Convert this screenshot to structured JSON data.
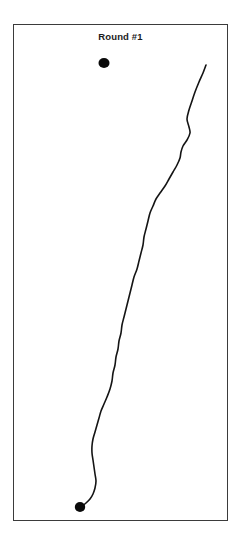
{
  "figure": {
    "title": "Round #1",
    "background_color": "#ffffff",
    "frame": {
      "border_color": "#3b3b3b",
      "border_width_px": 1.2,
      "x": 13,
      "y": 24,
      "width": 215,
      "height": 497
    }
  },
  "chart_data": {
    "type": "line",
    "title": "Round #1",
    "subtitle": "",
    "xlabel": "",
    "ylabel": "",
    "xlim": [
      13,
      228
    ],
    "ylim": [
      24,
      521
    ],
    "grid": false,
    "legend": null,
    "axes_visible": false,
    "tick_labels_x": [],
    "tick_labels_y": [],
    "series": [
      {
        "name": "track-path",
        "kind": "path",
        "color": "#141414",
        "line_width": 1.6,
        "points": [
          [
            206,
            65
          ],
          [
            203,
            73
          ],
          [
            199,
            82
          ],
          [
            195,
            92
          ],
          [
            192,
            101
          ],
          [
            189,
            110
          ],
          [
            187,
            119
          ],
          [
            189,
            127
          ],
          [
            190,
            133
          ],
          [
            187,
            140
          ],
          [
            183,
            146
          ],
          [
            181,
            152
          ],
          [
            180,
            158
          ],
          [
            177,
            165
          ],
          [
            173,
            172
          ],
          [
            169,
            179
          ],
          [
            165,
            186
          ],
          [
            160,
            193
          ],
          [
            156,
            199
          ],
          [
            153,
            206
          ],
          [
            150,
            213
          ],
          [
            148,
            221
          ],
          [
            146,
            229
          ],
          [
            144,
            237
          ],
          [
            143,
            245
          ],
          [
            141,
            253
          ],
          [
            139,
            261
          ],
          [
            137,
            269
          ],
          [
            134,
            277
          ],
          [
            132,
            285
          ],
          [
            130,
            293
          ],
          [
            128,
            301
          ],
          [
            126,
            309
          ],
          [
            124,
            317
          ],
          [
            122,
            325
          ],
          [
            121,
            333
          ],
          [
            119,
            341
          ],
          [
            118,
            349
          ],
          [
            116,
            357
          ],
          [
            115,
            365
          ],
          [
            113,
            373
          ],
          [
            112,
            381
          ],
          [
            110,
            389
          ],
          [
            107,
            397
          ],
          [
            104,
            404
          ],
          [
            101,
            411
          ],
          [
            99,
            418
          ],
          [
            97,
            425
          ],
          [
            95,
            432
          ],
          [
            93,
            439
          ],
          [
            92,
            446
          ],
          [
            92,
            453
          ],
          [
            93,
            460
          ],
          [
            94,
            467
          ],
          [
            95,
            474
          ],
          [
            96,
            481
          ],
          [
            95,
            488
          ],
          [
            93,
            494
          ],
          [
            90,
            499
          ],
          [
            86,
            503
          ],
          [
            82,
            506
          ],
          [
            80,
            507
          ]
        ]
      }
    ],
    "markers": [
      {
        "name": "start-marker-dot",
        "x": 104,
        "y": 63,
        "radius_x": 5.5,
        "radius_y": 5.0,
        "color": "#0a0a0a",
        "label": ""
      },
      {
        "name": "end-marker-dot",
        "x": 80,
        "y": 507,
        "radius_x": 5.2,
        "radius_y": 5.0,
        "color": "#0a0a0a",
        "label": ""
      }
    ]
  }
}
